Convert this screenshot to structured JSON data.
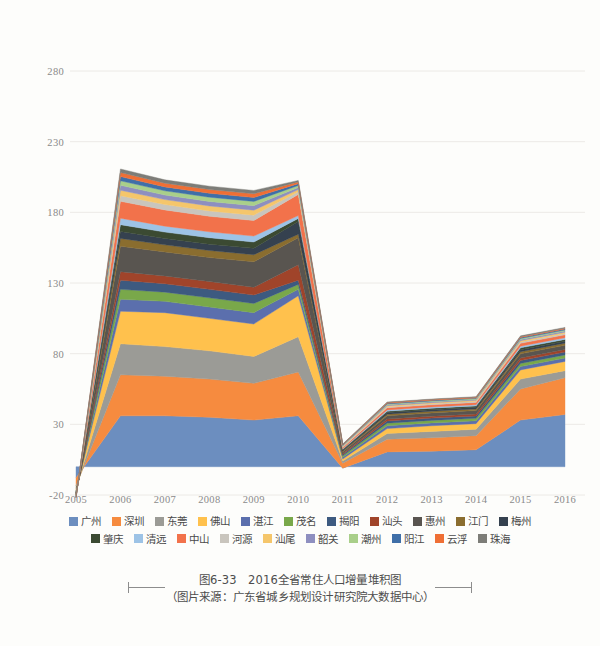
{
  "caption": {
    "title": "图6-33　2016全省常住人口增量堆积图",
    "source": "（图片来源：广东省城乡规划设计研究院大数据中心）"
  },
  "legend": {
    "rows": [
      [
        "广州",
        "深圳",
        "东莞",
        "佛山",
        "湛江",
        "茂名",
        "揭阳",
        "汕头",
        "惠州",
        "江门",
        "梅州"
      ],
      [
        "肇庆",
        "清远",
        "中山",
        "河源",
        "汕尾",
        "韶关",
        "潮州",
        "阳江",
        "云浮",
        "珠海"
      ]
    ]
  },
  "chart_data": {
    "type": "area",
    "stacked": true,
    "title": "2016全省常住人口增量堆积图",
    "xlabel": "",
    "ylabel": "",
    "grid": true,
    "legend_position": "bottom",
    "categories": [
      "2005",
      "2006",
      "2007",
      "2008",
      "2009",
      "2010",
      "2011",
      "2012",
      "2013",
      "2014",
      "2015",
      "2016"
    ],
    "yticks": [
      -20,
      30,
      80,
      130,
      180,
      230,
      280
    ],
    "ylim": [
      -20,
      300
    ],
    "xlim": [
      "2005",
      "2016"
    ],
    "series": [
      {
        "name": "广州",
        "color": "#6c8ebf",
        "values": [
          -8.0,
          36.0,
          36.0,
          35.0,
          33.0,
          36.0,
          -1.0,
          10.5,
          11.0,
          12.0,
          33.0,
          37.0
        ]
      },
      {
        "name": "深圳",
        "color": "#f68b3f",
        "values": [
          -5.5,
          29.0,
          28.0,
          27.0,
          26.0,
          31.0,
          3.5,
          9.0,
          9.5,
          10.0,
          22.0,
          26.0
        ]
      },
      {
        "name": "东莞",
        "color": "#9b9b96",
        "values": [
          -2.0,
          22.0,
          21.0,
          20.0,
          19.0,
          25.0,
          1.5,
          4.0,
          4.5,
          4.5,
          7.0,
          5.0
        ]
      },
      {
        "name": "佛山",
        "color": "#ffc14d",
        "values": [
          -1.5,
          23.0,
          24.0,
          23.0,
          23.0,
          29.0,
          1.5,
          3.5,
          4.0,
          4.0,
          6.5,
          6.5
        ]
      },
      {
        "name": "湛江",
        "color": "#5b6fad",
        "values": [
          -0.6,
          8.5,
          8.0,
          8.0,
          8.0,
          4.5,
          1.2,
          2.0,
          2.0,
          2.0,
          2.4,
          2.4
        ]
      },
      {
        "name": "茂名",
        "color": "#79a84a",
        "values": [
          -0.5,
          7.0,
          6.5,
          6.5,
          6.5,
          3.5,
          1.0,
          1.8,
          1.8,
          1.8,
          2.2,
          2.2
        ]
      },
      {
        "name": "揭阳",
        "color": "#3d5a80",
        "values": [
          -0.4,
          6.5,
          6.0,
          6.0,
          6.0,
          3.0,
          0.9,
          1.6,
          1.6,
          1.6,
          2.0,
          2.0
        ]
      },
      {
        "name": "汕头",
        "color": "#a0442a",
        "values": [
          -0.4,
          6.0,
          5.5,
          5.5,
          5.5,
          11.0,
          0.8,
          1.4,
          1.4,
          1.4,
          1.8,
          1.8
        ]
      },
      {
        "name": "惠州",
        "color": "#595550",
        "values": [
          -0.5,
          18.0,
          17.0,
          17.0,
          18.0,
          19.0,
          1.0,
          2.2,
          2.3,
          2.4,
          3.0,
          3.0
        ]
      },
      {
        "name": "江门",
        "color": "#8a6d2f",
        "values": [
          -0.3,
          5.5,
          5.0,
          5.0,
          5.0,
          2.5,
          0.7,
          1.2,
          1.2,
          1.2,
          1.5,
          1.5
        ]
      },
      {
        "name": "梅州",
        "color": "#35414f",
        "values": [
          -0.3,
          5.0,
          4.5,
          4.5,
          4.5,
          9.0,
          0.6,
          1.1,
          1.1,
          1.1,
          1.4,
          1.4
        ]
      },
      {
        "name": "肇庆",
        "color": "#3b4a32",
        "values": [
          -0.3,
          4.8,
          4.5,
          4.5,
          4.5,
          2.2,
          0.6,
          1.0,
          1.0,
          1.0,
          1.3,
          1.3
        ]
      },
      {
        "name": "清远",
        "color": "#9dc3e6",
        "values": [
          -0.2,
          4.5,
          4.2,
          4.2,
          4.2,
          2.0,
          0.5,
          0.9,
          0.9,
          0.9,
          1.2,
          1.2
        ]
      },
      {
        "name": "中山",
        "color": "#f2724b",
        "values": [
          -0.3,
          12.0,
          11.5,
          11.0,
          11.0,
          15.0,
          0.8,
          1.5,
          1.5,
          1.6,
          2.0,
          2.0
        ]
      },
      {
        "name": "河源",
        "color": "#c9c5bd",
        "values": [
          -0.2,
          4.0,
          3.8,
          3.8,
          3.8,
          1.8,
          0.5,
          0.8,
          0.8,
          0.8,
          1.0,
          1.0
        ]
      },
      {
        "name": "汕尾",
        "color": "#f5c66b",
        "values": [
          -0.2,
          3.8,
          3.5,
          3.5,
          3.5,
          1.6,
          0.4,
          0.7,
          0.7,
          0.7,
          0.9,
          0.9
        ]
      },
      {
        "name": "韶关",
        "color": "#8e8fc0",
        "values": [
          -0.2,
          3.5,
          3.2,
          3.2,
          3.2,
          1.5,
          0.4,
          0.6,
          0.6,
          0.6,
          0.8,
          0.8
        ]
      },
      {
        "name": "潮州",
        "color": "#a9cf8a",
        "values": [
          -0.2,
          3.2,
          3.0,
          3.0,
          3.0,
          1.4,
          0.3,
          0.6,
          0.6,
          0.6,
          0.7,
          0.7
        ]
      },
      {
        "name": "阳江",
        "color": "#3f6fa8",
        "values": [
          -0.2,
          3.0,
          2.8,
          2.8,
          2.8,
          1.3,
          0.3,
          0.5,
          0.5,
          0.5,
          0.7,
          0.7
        ]
      },
      {
        "name": "云浮",
        "color": "#ef6f35",
        "values": [
          -0.2,
          2.8,
          2.6,
          2.6,
          2.6,
          1.2,
          0.3,
          0.5,
          0.5,
          0.5,
          0.6,
          0.6
        ]
      },
      {
        "name": "珠海",
        "color": "#7d7d78",
        "values": [
          -0.2,
          2.6,
          2.4,
          2.4,
          2.4,
          1.1,
          0.3,
          0.4,
          0.4,
          0.4,
          0.6,
          0.6
        ]
      }
    ]
  }
}
